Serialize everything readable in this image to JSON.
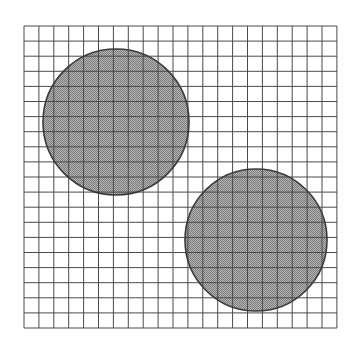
{
  "figure": {
    "background_color": "#ffffff",
    "width": 360,
    "height": 345
  },
  "grid": {
    "name": "square-grid",
    "x_start": 24,
    "y_start": 26,
    "x_end": 337,
    "y_end": 328,
    "cell_size_x": 14.9,
    "cell_size_y": 15.1,
    "columns": 21,
    "rows": 20,
    "line_color": "#4a4a4a",
    "line_width": 1,
    "style": "solid"
  },
  "shapes": [
    {
      "name": "circle-upper-left",
      "type": "circle",
      "cx": 116,
      "cy": 122,
      "r": 73,
      "fill_color": "#9a9a9a",
      "fill_pattern": "stipple-50",
      "stroke_color": "#3a3a3a",
      "stroke_width": 1.6
    },
    {
      "name": "circle-lower-right",
      "type": "circle",
      "cx": 256,
      "cy": 240,
      "r": 71,
      "fill_color": "#9a9a9a",
      "fill_pattern": "stipple-50",
      "stroke_color": "#3a3a3a",
      "stroke_width": 1.6
    }
  ],
  "chart_data": {
    "type": "scatter",
    "title": "",
    "xlabel": "",
    "ylabel": "",
    "grid": true,
    "legend": "none",
    "xlim": [
      0,
      21
    ],
    "ylim": [
      0,
      20
    ],
    "series": [
      {
        "name": "circles",
        "marker": "filled-circle",
        "points": [
          {
            "label": "circle-upper-left",
            "x": 6.2,
            "y": 13.6,
            "radius_cells": 4.9
          },
          {
            "label": "circle-lower-right",
            "x": 15.6,
            "y": 5.8,
            "radius_cells": 4.7
          }
        ]
      }
    ]
  }
}
